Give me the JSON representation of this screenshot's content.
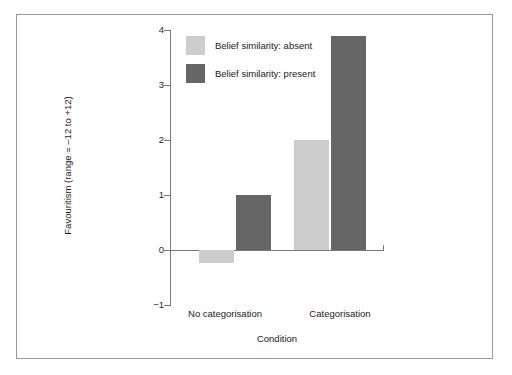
{
  "figure": {
    "background": "#ffffff",
    "frame_color": "#9a9a9a"
  },
  "chart_data": {
    "type": "bar",
    "title": "",
    "xlabel": "Condition",
    "ylabel": "Favouritism (range = ‒12 to +12)",
    "categories": [
      "No categorisation",
      "Categorisation"
    ],
    "series": [
      {
        "name": "Belief similarity: absent",
        "color": "#cdcdcd",
        "values": [
          -0.24,
          2.0
        ]
      },
      {
        "name": "Belief similarity: present",
        "color": "#666666",
        "values": [
          1.0,
          3.89
        ]
      }
    ],
    "ylim": [
      -1,
      4
    ],
    "yticks": [
      4,
      3,
      2,
      1,
      0,
      -1
    ],
    "ytick_labels": [
      "4",
      "3",
      "2",
      "1",
      "0",
      "−1"
    ],
    "grid": false,
    "legend_position": "upper-left-inside",
    "legend": [
      {
        "label": "Belief similarity: absent",
        "color": "#cdcdcd"
      },
      {
        "label": "Belief similarity: present",
        "color": "#666666"
      }
    ]
  }
}
